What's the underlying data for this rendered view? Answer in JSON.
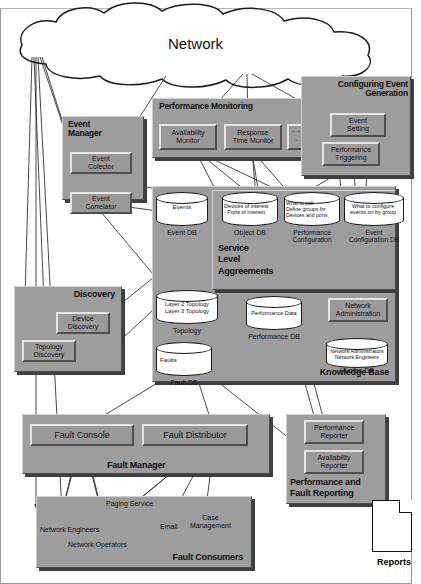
{
  "diagram": {
    "colors": {
      "panel_fill": "#9d9d9d",
      "module_fill": "#9a9a9a",
      "cylinder_fill": "#ffffff",
      "line": "#1a1a1a",
      "shadow": "#3f3f3f"
    },
    "cloud": {
      "label": "Network"
    },
    "groups": {
      "event_manager": {
        "title": "Event\nManager",
        "modules": [
          {
            "label": "Event\nColector"
          },
          {
            "label": "Event\nCorrelator"
          }
        ]
      },
      "performance_monitoring": {
        "title": "Performance Monitoring",
        "modules": [
          {
            "label": "Availability\nMonitor"
          },
          {
            "label": "Response\nTime Monitor"
          },
          {
            "label": "· · ·"
          }
        ]
      },
      "configuring_event_generation": {
        "title": "Configuring Event\nGeneration",
        "modules": [
          {
            "label": "Event\nSetting"
          },
          {
            "label": "Performance\nTriggering"
          }
        ]
      },
      "discovery": {
        "title": "Discovery",
        "modules": [
          {
            "label": "Device\nDiscovery"
          },
          {
            "label": "Topology\nDiscovery"
          }
        ]
      },
      "knowledge_base": {
        "title": "Knowledge Base",
        "service_level": {
          "title": "Service\nLevel\nAggreements"
        },
        "modules": [
          {
            "label": "Network\nAdministration"
          }
        ],
        "databases": [
          {
            "contents": "Events",
            "label": "Event DB"
          },
          {
            "contents": "Devices of interest\n- Ports of interest",
            "label": "Object DB"
          },
          {
            "contents": "What to poll\nDefine groups for\nDevices and ports",
            "label": "Performance\nConfiguration"
          },
          {
            "contents": "What to configure\nevents on by group",
            "label": "Event\nConfiguration DB"
          },
          {
            "contents": "Layer 2 Topology\nLayer 3 Topology",
            "label": "Topology"
          },
          {
            "contents": "Performance Data",
            "label": "Performance DB"
          },
          {
            "contents": "Faults",
            "label": "Fault DB"
          },
          {
            "contents": "Network Administrators\nNetwork Engineers",
            "label": "Human DB"
          }
        ]
      },
      "fault_manager": {
        "title": "Fault Manager",
        "modules": [
          {
            "label": "Fault Console"
          },
          {
            "label": "Fault Distributor"
          }
        ]
      },
      "fault_consumers": {
        "title": "Fault Consumers",
        "items": [
          {
            "label": "Paging Service"
          },
          {
            "label": "Network Engineers"
          },
          {
            "label": "Network Operators"
          },
          {
            "label": "Email"
          },
          {
            "label": "Case\nManagement"
          }
        ]
      },
      "performance_and_fault_reporting": {
        "title": "Performance and\nFault Reporting",
        "modules": [
          {
            "label": "Performance\nReporter"
          },
          {
            "label": "Availability\nReporter"
          }
        ]
      },
      "reports": {
        "label": "Reports"
      }
    }
  }
}
